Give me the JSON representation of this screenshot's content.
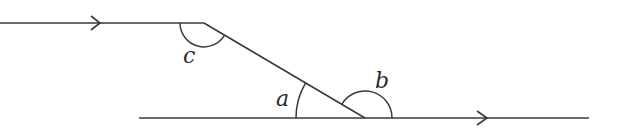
{
  "diagram": {
    "type": "parallel-lines-with-transversal",
    "colors": {
      "stroke": "#3a3a3a",
      "label": "#2a2a2a",
      "background": "#ffffff"
    },
    "lines": [
      {
        "id": "top-parallel-line",
        "x1": 0,
        "y1": 23,
        "x2": 204,
        "y2": 23,
        "arrow_at_x": 99
      },
      {
        "id": "transversal",
        "x1": 204,
        "y1": 23,
        "x2": 365,
        "y2": 118
      },
      {
        "id": "bottom-parallel-line",
        "x1": 139,
        "y1": 118,
        "x2": 589,
        "y2": 118,
        "arrow_at_x": 487
      }
    ],
    "angles": [
      {
        "label": "c",
        "vertex": [
          204,
          23
        ],
        "label_pos": [
          183,
          63
        ]
      },
      {
        "label": "a",
        "vertex": [
          365,
          118
        ],
        "label_pos": [
          276,
          106
        ]
      },
      {
        "label": "b",
        "vertex": [
          365,
          118
        ],
        "label_pos": [
          375,
          88
        ]
      }
    ]
  }
}
